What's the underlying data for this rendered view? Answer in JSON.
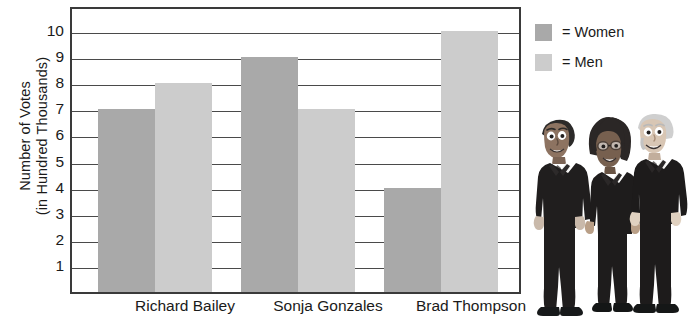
{
  "chart_data": {
    "type": "bar",
    "title": "",
    "xlabel": "",
    "ylabel": "Number of Votes (in Hundred Thousands)",
    "ylabel_lines": [
      "Number of Votes",
      "(in Hundred Thousands)"
    ],
    "categories": [
      "Richard Bailey",
      "Sonja Gonzales",
      "Brad Thompson"
    ],
    "series": [
      {
        "name": "Women",
        "color": "#a9a9a9",
        "values": [
          7,
          9,
          4
        ]
      },
      {
        "name": "Men",
        "color": "#cccccc",
        "values": [
          8,
          7,
          10
        ]
      }
    ],
    "ylim": [
      0,
      11
    ],
    "yticks": [
      10,
      9,
      8,
      7,
      6,
      5,
      4,
      3,
      2,
      1
    ],
    "ytick_labels": [
      "10",
      "9",
      "8",
      "7",
      "6",
      "5",
      "4",
      "3",
      "2",
      "1"
    ],
    "grid": true,
    "legend_position": "right-top"
  },
  "legend": {
    "items": [
      {
        "marker": "legend-swatch-women",
        "label": "= Women",
        "color": "#a9a9a9"
      },
      {
        "marker": "legend-swatch-men",
        "label": "= Men",
        "color": "#cccccc"
      }
    ]
  },
  "illustration": {
    "name": "three-candidates-illustration",
    "description": "Cartoon illustration of three people in dark business suits"
  }
}
